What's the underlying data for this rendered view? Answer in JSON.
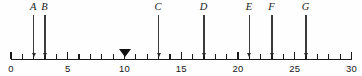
{
  "figure": {
    "background_color": "#fefefe",
    "line_color": "#1a1a1a",
    "marker_color": "#111111"
  },
  "chart_data": {
    "type": "scatter",
    "title": "",
    "xlabel": "",
    "ylabel": "",
    "xlim": [
      0,
      30
    ],
    "grid": false,
    "legend": "none",
    "axis": {
      "min": 0,
      "max": 30,
      "tick_step": 1,
      "label_step": 5,
      "tick_labels": [
        "0",
        "5",
        "10",
        "15",
        "20",
        "25",
        "30"
      ],
      "tick_label_values": [
        0,
        5,
        10,
        15,
        20,
        25,
        30
      ]
    },
    "categories": [
      "A",
      "B",
      "C",
      "D",
      "E",
      "F",
      "G"
    ],
    "values": [
      2,
      3,
      13,
      17,
      21,
      23,
      26
    ],
    "points": [
      {
        "label": "A",
        "value": 2
      },
      {
        "label": "B",
        "value": 3
      },
      {
        "label": "C",
        "value": 13
      },
      {
        "label": "D",
        "value": 17
      },
      {
        "label": "E",
        "value": 21
      },
      {
        "label": "F",
        "value": 23
      },
      {
        "label": "G",
        "value": 26
      }
    ],
    "annotations": [
      {
        "name": "triangle-marker",
        "shape": "down-triangle",
        "value": 10
      }
    ]
  }
}
